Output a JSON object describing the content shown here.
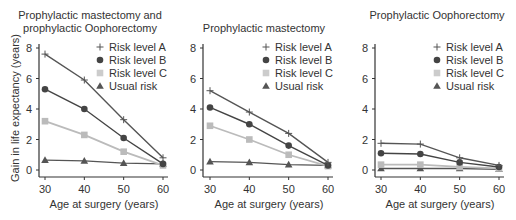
{
  "chart_data": [
    {
      "type": "line",
      "title": "Prophylactic mastectomy and prophylactic Oophorectomy",
      "title_lines": [
        "Prophylactic mastectomy and",
        "prophylactic Oophorectomy"
      ],
      "xlabel": "Age at surgery (years)",
      "ylabel": "Gain in life expectancy (years)",
      "x": [
        30,
        40,
        50,
        60
      ],
      "ylim": [
        0,
        8
      ],
      "yticks": [
        0,
        2,
        4,
        6,
        8
      ],
      "legend_position": "upper right",
      "series": [
        {
          "name": "Risk level A",
          "marker": "plus",
          "color": "#555555",
          "values": [
            7.6,
            5.9,
            3.3,
            0.8
          ]
        },
        {
          "name": "Risk level B",
          "marker": "circle",
          "color": "#444444",
          "values": [
            5.3,
            4.0,
            2.1,
            0.4
          ]
        },
        {
          "name": "Risk level C",
          "marker": "square",
          "color": "#bbbbbb",
          "values": [
            3.2,
            2.3,
            1.2,
            0.3
          ]
        },
        {
          "name": "Usual risk",
          "marker": "triangle",
          "color": "#555555",
          "values": [
            0.65,
            0.6,
            0.45,
            0.4
          ]
        }
      ]
    },
    {
      "type": "line",
      "title": "Prophylactic mastectomy",
      "title_lines": [
        "Prophylactic mastectomy"
      ],
      "xlabel": "Age at surgery (years)",
      "ylabel": "",
      "x": [
        30,
        40,
        50,
        60
      ],
      "ylim": [
        0,
        8
      ],
      "yticks": [
        0,
        2,
        4,
        6,
        8
      ],
      "legend_position": "upper right",
      "series": [
        {
          "name": "Risk level A",
          "marker": "plus",
          "color": "#555555",
          "values": [
            5.2,
            3.8,
            2.4,
            0.5
          ]
        },
        {
          "name": "Risk level B",
          "marker": "circle",
          "color": "#444444",
          "values": [
            4.1,
            3.0,
            1.6,
            0.3
          ]
        },
        {
          "name": "Risk level C",
          "marker": "square",
          "color": "#bbbbbb",
          "values": [
            2.9,
            2.0,
            1.0,
            0.25
          ]
        },
        {
          "name": "Usual risk",
          "marker": "triangle",
          "color": "#555555",
          "values": [
            0.55,
            0.5,
            0.35,
            0.3
          ]
        }
      ]
    },
    {
      "type": "line",
      "title": "Prophylactic Oophorectomy",
      "title_lines": [
        "Prophylactic Oophorectomy"
      ],
      "xlabel": "Age at surgery (years)",
      "ylabel": "",
      "x": [
        30,
        40,
        50,
        60
      ],
      "ylim": [
        0,
        8
      ],
      "yticks": [
        0,
        2,
        4,
        6,
        8
      ],
      "legend_position": "upper right",
      "series": [
        {
          "name": "Risk level A",
          "marker": "plus",
          "color": "#555555",
          "values": [
            1.75,
            1.7,
            0.8,
            0.3
          ]
        },
        {
          "name": "Risk level B",
          "marker": "circle",
          "color": "#444444",
          "values": [
            1.1,
            1.05,
            0.5,
            0.2
          ]
        },
        {
          "name": "Risk level C",
          "marker": "square",
          "color": "#bbbbbb",
          "values": [
            0.35,
            0.35,
            0.2,
            0.1
          ]
        },
        {
          "name": "Usual risk",
          "marker": "triangle",
          "color": "#555555",
          "values": [
            0.1,
            0.1,
            0.1,
            0.05
          ]
        }
      ]
    }
  ]
}
